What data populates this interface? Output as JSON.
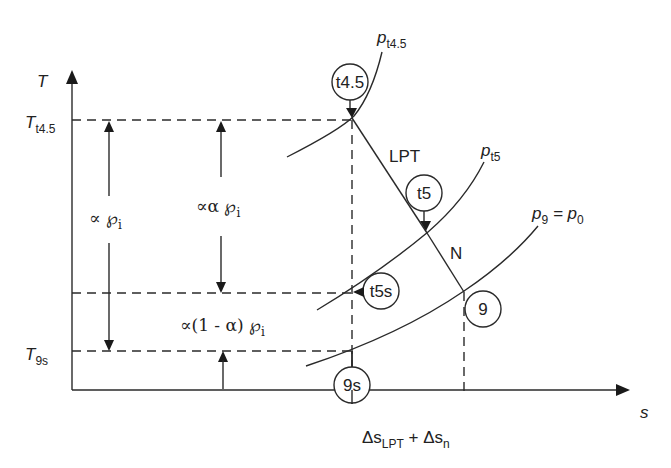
{
  "diagram": {
    "axes": {
      "y_label": "T",
      "x_label": "s",
      "y_ticks": [
        {
          "main": "T",
          "sub": "t4.5"
        },
        {
          "main": "T",
          "sub": "9s"
        }
      ],
      "x_annotation": {
        "part1": "Δs",
        "sub1": "LPT",
        "plus": " + Δs",
        "sub2": "n"
      }
    },
    "isobars": [
      {
        "main": "p",
        "sub": "t4.5"
      },
      {
        "main": "p",
        "sub": "t5"
      },
      {
        "main": "p",
        "sub": "9",
        "eq": " = p",
        "sub2": "0"
      }
    ],
    "states": {
      "t45": "t4.5",
      "t5": "t5",
      "t5s": "t5s",
      "s9": "9",
      "s9s": "9s"
    },
    "process_labels": {
      "lpt": "LPT",
      "nozzle": "N"
    },
    "energy_labels": {
      "total": {
        "prefix": "∝ ℘",
        "sub": "i"
      },
      "alpha": {
        "prefix": "∝α ℘",
        "sub": "i"
      },
      "one_minus_alpha": {
        "prefix": "∝(1 - α) ℘",
        "sub": "i"
      }
    }
  }
}
